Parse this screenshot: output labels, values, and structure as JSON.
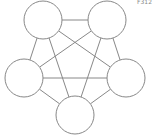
{
  "corner_label": "F312",
  "stroke_color": "#888888",
  "nodes": [
    {
      "id": "top-left",
      "cx": 43,
      "cy": 20,
      "r": 19
    },
    {
      "id": "top-right",
      "cx": 107,
      "cy": 20,
      "r": 19
    },
    {
      "id": "left",
      "cx": 24,
      "cy": 78,
      "r": 19
    },
    {
      "id": "right",
      "cx": 126,
      "cy": 78,
      "r": 19
    },
    {
      "id": "bottom",
      "cx": 75,
      "cy": 115,
      "r": 19
    }
  ],
  "edges": [
    [
      "top-left",
      "top-right"
    ],
    [
      "top-left",
      "left"
    ],
    [
      "top-left",
      "right"
    ],
    [
      "top-left",
      "bottom"
    ],
    [
      "top-right",
      "left"
    ],
    [
      "top-right",
      "right"
    ],
    [
      "top-right",
      "bottom"
    ],
    [
      "left",
      "right"
    ],
    [
      "left",
      "bottom"
    ],
    [
      "right",
      "bottom"
    ]
  ]
}
